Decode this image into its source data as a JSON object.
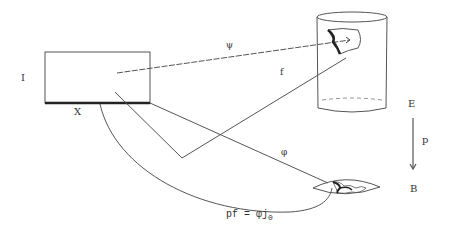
{
  "diagram": {
    "labels": {
      "I": "I",
      "X": "X",
      "psi": "ψ",
      "f": "f",
      "phi": "φ",
      "E": "E",
      "p": "p",
      "B": "B",
      "equation_lhs": "pf = φj",
      "equation_sub": "0"
    },
    "nodes": [
      {
        "id": "square",
        "label": "I × X rectangle"
      },
      {
        "id": "total_space",
        "label": "E cylinder"
      },
      {
        "id": "base_space",
        "label": "B lens"
      }
    ],
    "edges": [
      {
        "from": "square",
        "to": "total_space",
        "label": "ψ"
      },
      {
        "from": "square",
        "to": "total_space",
        "label": "f"
      },
      {
        "from": "square",
        "to": "base_space",
        "label": "φ"
      },
      {
        "from": "X",
        "to": "base_space",
        "label": "pf = φj0"
      },
      {
        "from": "E",
        "to": "B",
        "label": "p"
      }
    ],
    "colors": {
      "stroke": "#444444",
      "thick": "#222222",
      "background": "#ffffff"
    }
  }
}
